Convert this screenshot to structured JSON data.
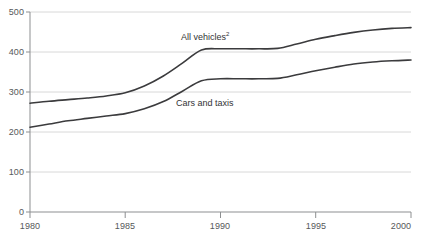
{
  "chart_data": {
    "type": "line",
    "title": "",
    "subtitle": "",
    "xlabel": "",
    "ylabel": "",
    "xlim": [
      1980,
      2000
    ],
    "ylim": [
      0,
      500
    ],
    "grid": true,
    "grid_axis": "y",
    "legend": "inline-labels",
    "yticks": [
      0,
      100,
      200,
      300,
      400,
      500
    ],
    "ytick_labels": [
      "0",
      "100",
      "200",
      "300",
      "400",
      "500"
    ],
    "xticks": [
      1980,
      1985,
      1990,
      1995,
      2000
    ],
    "xtick_labels": [
      "1980",
      "1985",
      "1990",
      "1995",
      "2000"
    ],
    "x": [
      1980,
      1981,
      1982,
      1983,
      1984,
      1985,
      1986,
      1987,
      1988,
      1989,
      1990,
      1991,
      1992,
      1993,
      1994,
      1995,
      1996,
      1997,
      1998,
      1999,
      2000
    ],
    "series": [
      {
        "name": "All vehicles",
        "label": "All vehicles",
        "superscript": "2",
        "color": "#3b3b3d",
        "values": [
          272,
          277,
          281,
          285,
          290,
          298,
          315,
          340,
          372,
          405,
          408,
          408,
          408,
          409,
          420,
          432,
          441,
          449,
          455,
          459,
          461
        ]
      },
      {
        "name": "Cars and taxis",
        "label": "Cars and taxis",
        "superscript": "",
        "color": "#3b3b3d",
        "values": [
          212,
          220,
          228,
          234,
          240,
          246,
          258,
          276,
          302,
          328,
          333,
          333,
          333,
          334,
          343,
          353,
          362,
          370,
          375,
          378,
          380
        ]
      }
    ],
    "annotations": [
      {
        "text": "All vehicles",
        "superscript": "2",
        "x": 1988,
        "y": 440
      },
      {
        "text": "Cars and taxis",
        "superscript": "",
        "x": 1988,
        "y": 300
      }
    ]
  },
  "axes": {
    "ytick_0": "0",
    "ytick_100": "100",
    "ytick_200": "200",
    "ytick_300": "300",
    "ytick_400": "400",
    "ytick_500": "500",
    "xtick_1980": "1980",
    "xtick_1985": "1985",
    "xtick_1990": "1990",
    "xtick_1995": "1995",
    "xtick_2000": "2000"
  },
  "labels": {
    "all_vehicles": "All vehicles",
    "all_vehicles_superscript": "2",
    "cars_and_taxis": "Cars and taxis"
  },
  "colors": {
    "line": "#3b3b3d",
    "grid": "#d8d8d8",
    "axis": "#8d8f91",
    "tick_text": "#56585a",
    "background": "#ffffff"
  }
}
